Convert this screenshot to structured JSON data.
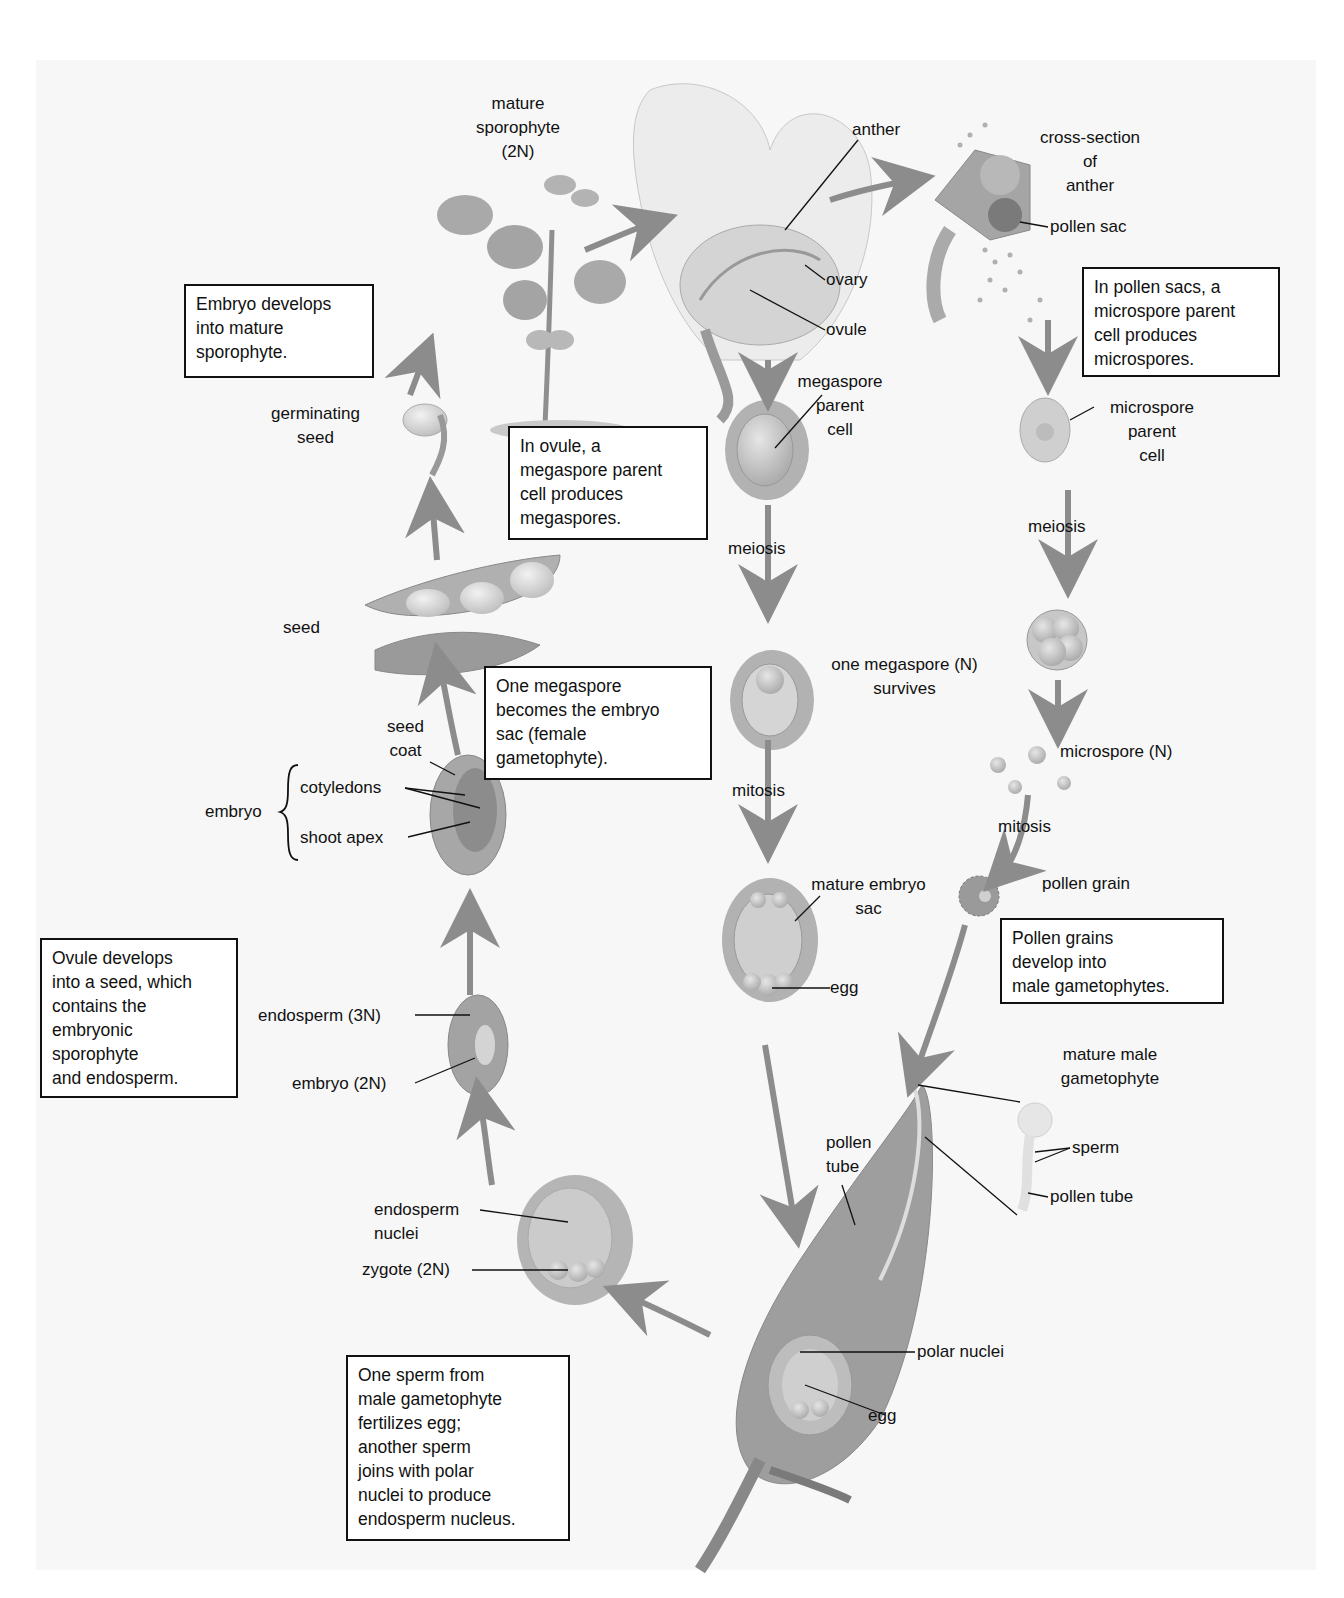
{
  "diagram": {
    "type": "life-cycle",
    "colors": {
      "background": "#f7f7f7",
      "arrow": "#8c8c8c",
      "cell_fill": "#b5b5b5",
      "cell_light": "#dcdcdc",
      "text": "#111111"
    }
  },
  "labels": {
    "mature_sporophyte": [
      "mature",
      "sporophyte",
      "(2N)"
    ],
    "anther": "anther",
    "cross_section": [
      "cross-section",
      "of",
      "anther"
    ],
    "pollen_sac": "pollen sac",
    "ovary": "ovary",
    "ovule": "ovule",
    "megaspore_parent_cell": [
      "megaspore",
      "parent",
      "cell"
    ],
    "microspore_parent_cell": [
      "microspore",
      "parent",
      "cell"
    ],
    "germinating_seed": [
      "germinating",
      "seed"
    ],
    "meiosis_left": "meiosis",
    "meiosis_right": "meiosis",
    "seed": "seed",
    "one_megaspore": [
      "one megaspore (N)",
      "survives"
    ],
    "microspore": "microspore (N)",
    "seed_coat": [
      "seed",
      "coat"
    ],
    "embryo": "embryo",
    "cotyledons": "cotyledons",
    "shoot_apex": "shoot apex",
    "mitosis_left": "mitosis",
    "mitosis_right": "mitosis",
    "mature_embryo_sac": [
      "mature embryo",
      "sac"
    ],
    "pollen_grain": "pollen grain",
    "egg_top": "egg",
    "endosperm_3n": "endosperm (3N)",
    "embryo_2n": "embryo (2N)",
    "mature_male_gametophyte": [
      "mature male",
      "gametophyte"
    ],
    "pollen_tube_left": [
      "pollen",
      "tube"
    ],
    "sperm": "sperm",
    "pollen_tube_right": "pollen tube",
    "endosperm_nuclei": [
      "endosperm",
      "nuclei"
    ],
    "zygote": "zygote (2N)",
    "polar_nuclei": "polar nuclei",
    "egg_bottom": "egg"
  },
  "boxes": {
    "embryo_develops": [
      "Embryo develops",
      "into mature",
      "sporophyte."
    ],
    "in_pollen_sacs": [
      "In pollen sacs, a",
      "microspore parent",
      "cell produces",
      "microspores."
    ],
    "in_ovule": [
      "In ovule, a",
      "megaspore parent",
      "cell produces",
      "megaspores."
    ],
    "one_megaspore_becomes": [
      "One megaspore",
      "becomes the embryo",
      "sac (female",
      "gametophyte)."
    ],
    "ovule_develops": [
      "Ovule develops",
      "into a seed, which",
      "contains the",
      "embryonic",
      "sporophyte",
      "and endosperm."
    ],
    "pollen_grains_develop": [
      "Pollen grains",
      "develop into",
      "male gametophytes."
    ],
    "one_sperm": [
      "One sperm from",
      "male gametophyte",
      "fertilizes egg;",
      "another sperm",
      "joins with polar",
      "nuclei to produce",
      "endosperm nucleus."
    ]
  }
}
